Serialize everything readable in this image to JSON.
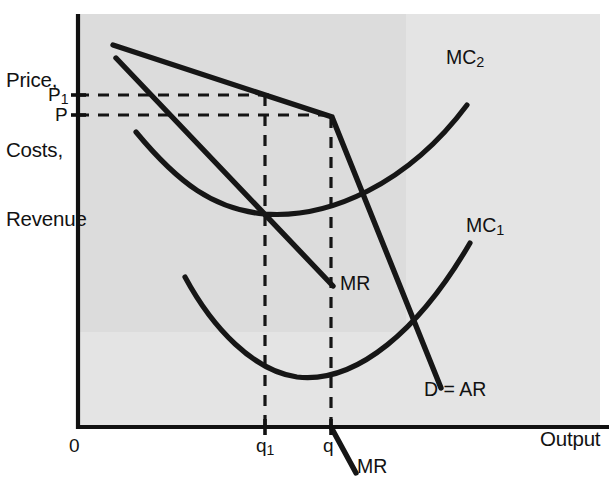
{
  "figure": {
    "type": "kinked-demand-curve-diagram",
    "background_color": "#ffffff",
    "plot_fill_color": "#e2e2e2",
    "plot_fill_inner_color": "#dcdcdc",
    "line_color": "#161616",
    "axes": {
      "y_axis_title_lines": [
        "Price,",
        "Costs,",
        "Revenue"
      ],
      "x_axis_title": "Output",
      "origin_label": "0"
    },
    "y_ticks": [
      {
        "label": "P",
        "sub": "1",
        "y": 95
      },
      {
        "label": "P",
        "sub": "",
        "y": 115
      }
    ],
    "x_ticks": [
      {
        "label": "q",
        "sub": "1",
        "x": 265
      },
      {
        "label": "q",
        "sub": "",
        "x": 331
      }
    ],
    "curve_labels": [
      {
        "name": "mc2-label",
        "label": "MC",
        "sub": "2",
        "x": 446,
        "y": 56
      },
      {
        "name": "mc1-label",
        "label": "MC",
        "sub": "1",
        "x": 466,
        "y": 224
      },
      {
        "name": "mr-interior-label",
        "label": "MR",
        "sub": "",
        "x": 340,
        "y": 273
      },
      {
        "name": "demand-label",
        "label": "D = AR",
        "sub": "",
        "x": 424,
        "y": 379
      },
      {
        "name": "mr-lower-label",
        "label": "MR",
        "sub": "",
        "x": 357,
        "y": 455
      }
    ],
    "geometry": {
      "plot_left": 78,
      "plot_right": 600,
      "plot_top": 14,
      "plot_bottom": 427,
      "inner_shade": {
        "x": 78,
        "y": 14,
        "w": 328,
        "h": 318
      },
      "demand_flat": "M113,45 L332,117",
      "demand_steep": "M332,117 L441,388",
      "mr_upper": "M116,58 L333,286",
      "mr_lower": "M331,427 L356,472",
      "mc1_path": "M185,277 C215,330 255,372 298,377 C358,384 420,330 470,243",
      "mc2_path": "M136,132 C180,185 215,210 265,214 C330,219 408,185 467,105",
      "dash_p1_y": 95,
      "dash_p_y": 115,
      "dash_q1_x": 265,
      "dash_q_x": 331
    }
  }
}
